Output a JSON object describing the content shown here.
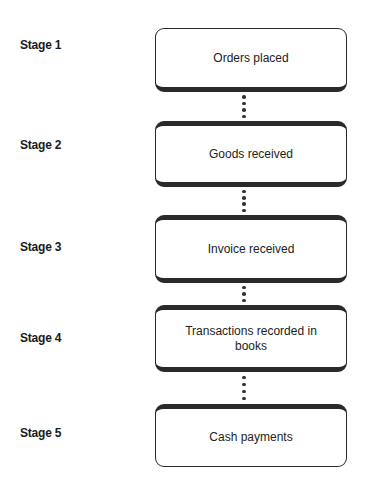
{
  "diagram": {
    "type": "vertical process flow",
    "stages": [
      {
        "label": "Stage 1",
        "step": "Orders placed"
      },
      {
        "label": "Stage 2",
        "step": "Goods received"
      },
      {
        "label": "Stage 3",
        "step": "Invoice received"
      },
      {
        "label": "Stage 4",
        "step": "Transactions recorded in books"
      },
      {
        "label": "Stage 5",
        "step": "Cash payments"
      }
    ],
    "connector_style": "dotted",
    "colors": {
      "border": "#2a2a2a",
      "text": "#1a1a1a",
      "background": "#ffffff"
    }
  }
}
